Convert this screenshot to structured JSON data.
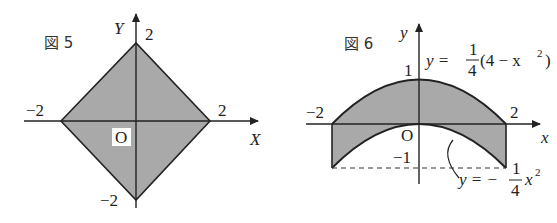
{
  "figure5": {
    "caption": "図 5",
    "x_axis_label": "X",
    "y_axis_label": "Y",
    "origin_label": "O",
    "tick_x_neg": "−2",
    "tick_x_pos": "2",
    "tick_y_pos": "2",
    "tick_y_neg": "−2",
    "region": "|X| + |Y| ≤ 2 (square with vertices (±2,0),(0,±2))",
    "fill_color": "#a9a9a9"
  },
  "figure6": {
    "caption": "図 6",
    "x_axis_label": "x",
    "y_axis_label": "y",
    "origin_label": "O",
    "tick_x_neg": "−2",
    "tick_x_pos": "2",
    "tick_y_1": "1",
    "tick_y_neg1": "−1",
    "upper_curve": {
      "y": "y =",
      "frac_num": "1",
      "frac_den": "4",
      "rest": "(4 − x",
      "sup": "2",
      "close": ")"
    },
    "lower_curve": {
      "y": "y = −",
      "frac_num": "1",
      "frac_den": "4",
      "rest": "x",
      "sup": "2"
    },
    "fill_color": "#a9a9a9"
  }
}
